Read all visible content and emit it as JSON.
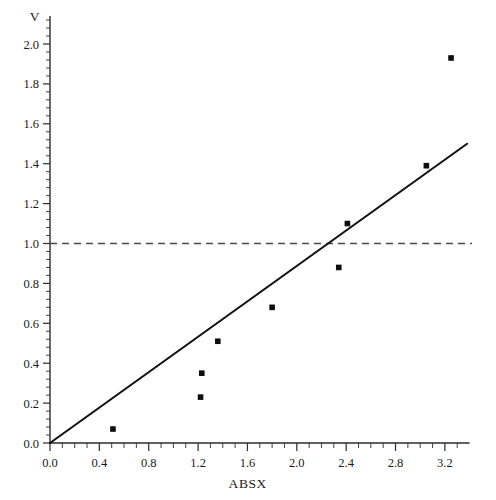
{
  "chart_data": {
    "type": "scatter",
    "title": "",
    "xlabel": "ABSX",
    "ylabel": "V",
    "xlim": [
      0.0,
      3.4
    ],
    "ylim": [
      0.0,
      2.05
    ],
    "grid": false,
    "legend": "none",
    "x_ticks": [
      "0.0",
      "0.4",
      "0.8",
      "1.2",
      "1.6",
      "2.0",
      "2.4",
      "2.8",
      "3.2"
    ],
    "x_tick_values": [
      0.0,
      0.4,
      0.8,
      1.2,
      1.6,
      2.0,
      2.4,
      2.8,
      3.2
    ],
    "x_minor_per_major": 4,
    "y_ticks": [
      "0.0",
      "0.2",
      "0.4",
      "0.6",
      "0.8",
      "1.0",
      "1.2",
      "1.4",
      "1.6",
      "1.8",
      "2.0"
    ],
    "y_tick_values": [
      0.0,
      0.2,
      0.4,
      0.6,
      0.8,
      1.0,
      1.2,
      1.4,
      1.6,
      1.8,
      2.0
    ],
    "y_minor_per_major": 5,
    "points": [
      {
        "x": 0.51,
        "y": 0.07
      },
      {
        "x": 1.22,
        "y": 0.23
      },
      {
        "x": 1.23,
        "y": 0.35
      },
      {
        "x": 1.36,
        "y": 0.51
      },
      {
        "x": 1.8,
        "y": 0.68
      },
      {
        "x": 2.34,
        "y": 0.88
      },
      {
        "x": 2.41,
        "y": 1.1
      },
      {
        "x": 3.05,
        "y": 1.39
      },
      {
        "x": 3.25,
        "y": 1.93
      }
    ],
    "series": [
      {
        "name": "fit-line",
        "style": "solid",
        "x": [
          0.0,
          3.38
        ],
        "y": [
          0.0,
          1.5
        ]
      },
      {
        "name": "reference-line",
        "style": "dashed",
        "x": [
          0.0,
          3.42
        ],
        "y": [
          1.0,
          1.0
        ]
      }
    ]
  },
  "axes": {
    "x_title": "ABSX",
    "y_title": "V"
  }
}
